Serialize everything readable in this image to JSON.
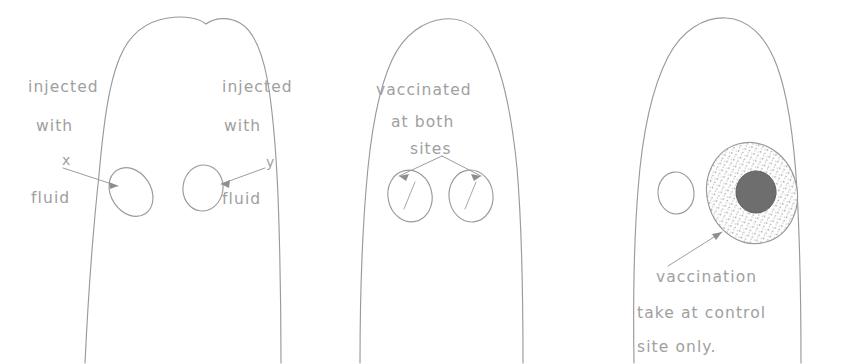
{
  "figure": {
    "ink_color": "#9a9a9a",
    "text_color": "#a0a0a0",
    "background_color": "#ffffff",
    "lesion_core_color": "#6e6e6e"
  },
  "panels": [
    {
      "id": "panel-left",
      "name": "injection-sites-panel",
      "labels": {
        "left_line1": "injected",
        "left_line2": "with",
        "left_marker": "x",
        "left_line3": "fluid",
        "right_line1": "injected",
        "right_line2": "with",
        "right_marker": "y",
        "right_line3": "fluid"
      },
      "sites": [
        {
          "name": "left-injection-site",
          "marking": "none"
        },
        {
          "name": "right-injection-site",
          "marking": "none"
        }
      ]
    },
    {
      "id": "panel-middle",
      "name": "vaccination-panel",
      "labels": {
        "line1": "vaccinated",
        "line2": "at both",
        "line3": "sites"
      },
      "sites": [
        {
          "name": "left-vaccination-site",
          "marking": "slash"
        },
        {
          "name": "right-vaccination-site",
          "marking": "slash"
        }
      ]
    },
    {
      "id": "panel-right",
      "name": "outcome-panel",
      "labels": {
        "line1": "vaccination",
        "line2": "take  at control",
        "line3": "site only."
      },
      "sites": [
        {
          "name": "test-site-no-take",
          "marking": "empty"
        },
        {
          "name": "control-site-take",
          "marking": "stippled-lesion-with-core"
        }
      ]
    }
  ]
}
